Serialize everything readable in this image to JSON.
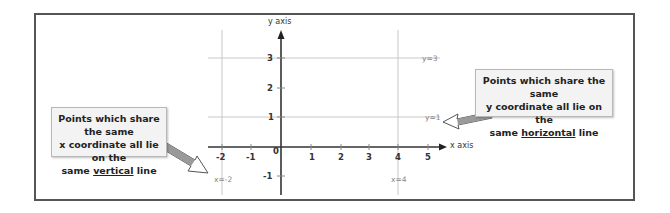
{
  "diagram": {
    "axes": {
      "x_label": "x axis",
      "y_label": "y axis",
      "x_ticks": [
        "-2",
        "-1",
        "0",
        "1",
        "2",
        "3",
        "4",
        "5"
      ],
      "y_ticks": [
        "3",
        "2",
        "1",
        "-1"
      ]
    },
    "lines": {
      "horizontal": [
        {
          "label": "y=3",
          "y": 3
        },
        {
          "label": "y=1",
          "y": 1
        }
      ],
      "vertical": [
        {
          "label": "x=-2",
          "x": -2
        },
        {
          "label": "x=4",
          "x": 4
        }
      ]
    },
    "callouts": {
      "left": {
        "line1": "Points which share the same",
        "line2": "x coordinate all lie on the",
        "line3_pre": "same ",
        "line3_em": "vertical",
        "line3_post": " line"
      },
      "right": {
        "line1": "Points which share the same",
        "line2": "y coordinate all lie on the",
        "line3_pre": "same ",
        "line3_em": "horizontal",
        "line3_post": " line"
      }
    },
    "colors": {
      "frame": "#555555",
      "axis": "#333333",
      "grid": "#c8c8c8",
      "label": "#888888",
      "callout_bg": "#f3f3f3",
      "arrow_fill": "#9a9a9a"
    }
  }
}
